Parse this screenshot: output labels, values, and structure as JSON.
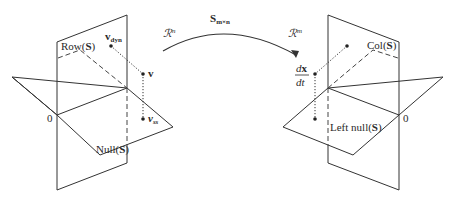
{
  "mapping": {
    "label_main": "S",
    "label_sub": "m×n",
    "domain_space": "ℛ",
    "domain_exp": "n",
    "codomain_space": "ℛ",
    "codomain_exp": "m"
  },
  "left_figure": {
    "row_label_prefix": "Row(",
    "row_label_S": "S",
    "row_label_suffix": ")",
    "null_label_prefix": "Null(",
    "null_label_S": "S",
    "null_label_suffix": ")",
    "origin": "0",
    "v_dyn_main": "v",
    "v_dyn_sub": "dyn",
    "v_main": "v",
    "v_ss_main": "v",
    "v_ss_sub": "ss"
  },
  "right_figure": {
    "col_label_prefix": "Col(",
    "col_label_S": "S",
    "col_label_suffix": ")",
    "leftnull_label_prefix": "Left null(",
    "leftnull_label_S": "S",
    "leftnull_label_suffix": ")",
    "origin": "0",
    "deriv_num_d": "d",
    "deriv_num_x": "x",
    "deriv_den": "dt"
  },
  "colors": {
    "line": "#333333",
    "text": "#2a2a2a",
    "background": "#ffffff"
  }
}
